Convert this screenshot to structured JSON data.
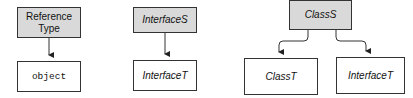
{
  "colors": {
    "source_fill": "#d9d9d9",
    "target_fill": "#ffffff",
    "stroke": "#333333"
  },
  "diagrams": [
    {
      "source": {
        "label": "Reference\nType",
        "line1": "Reference",
        "line2": "Type"
      },
      "targets": [
        {
          "label": "object"
        }
      ]
    },
    {
      "source": {
        "label": "InterfaceS"
      },
      "targets": [
        {
          "label": "InterfaceT"
        }
      ]
    },
    {
      "source": {
        "label": "ClassS"
      },
      "targets": [
        {
          "label": "ClassT"
        },
        {
          "label": "InterfaceT"
        }
      ]
    }
  ]
}
